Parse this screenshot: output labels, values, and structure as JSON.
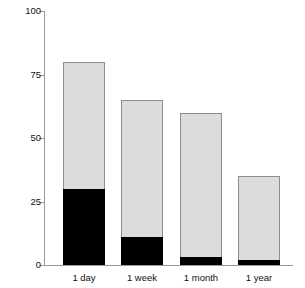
{
  "chart_data": {
    "type": "bar",
    "title": "",
    "subtitle": "",
    "xlabel": "",
    "ylabel": "Percentage pain relief",
    "ylim": [
      0,
      100
    ],
    "yticks": [
      0,
      25,
      50,
      75,
      100
    ],
    "ytick_labels": [
      "0",
      "25",
      "50",
      "75",
      "100"
    ],
    "grid": false,
    "legend": null,
    "stacked": true,
    "categories": [
      "1 day",
      "1 week",
      "1 month",
      "1 year"
    ],
    "series": [
      {
        "name": "complete-pain-relief",
        "color": "#000000",
        "values": [
          30,
          11,
          3,
          2
        ]
      },
      {
        "name": "any-pain-relief",
        "color": "#dcdcdc",
        "values": [
          80,
          65,
          60,
          35
        ]
      }
    ]
  },
  "axis": {
    "y_title": "Percentage pain relief",
    "axis_color": "#9a9a9a",
    "bar_fill": "#dcdcdc",
    "bar_border": "#8d8d8d",
    "bar_dark": "#000000"
  },
  "ticks": {
    "t0": "0",
    "t1": "25",
    "t2": "50",
    "t3": "75",
    "t4": "100"
  },
  "xlabels": {
    "b0": "1 day",
    "b1": "1 week",
    "b2": "1 month",
    "b3": "1 year"
  }
}
